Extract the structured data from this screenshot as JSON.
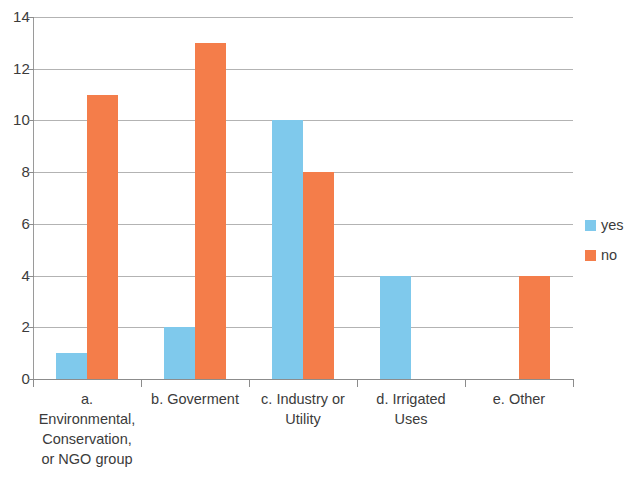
{
  "chart_data": {
    "type": "bar",
    "title": "",
    "xlabel": "",
    "ylabel": "",
    "ylim": [
      0,
      14
    ],
    "ytick_step": 2,
    "yticks": [
      0,
      2,
      4,
      6,
      8,
      10,
      12,
      14
    ],
    "grid": true,
    "legend_position": "right",
    "categories": [
      "a. Environmental, Conservation, or NGO group",
      "b. Goverment",
      "c. Industry or Utility",
      "d. Irrigated Uses",
      "e. Other"
    ],
    "category_lines": [
      [
        "a.",
        "Environmental,",
        "Conservation,",
        "or NGO group"
      ],
      [
        "b. Goverment"
      ],
      [
        "c. Industry or",
        "Utility"
      ],
      [
        "d. Irrigated",
        "Uses"
      ],
      [
        "e. Other"
      ]
    ],
    "series": [
      {
        "name": "yes",
        "color": "#7fc9ec",
        "values": [
          1,
          2,
          10,
          4,
          0
        ]
      },
      {
        "name": "no",
        "color": "#f47d4a",
        "values": [
          11,
          13,
          8,
          0,
          4
        ]
      }
    ]
  },
  "legend": {
    "items": [
      {
        "label": "yes",
        "color": "#7fc9ec"
      },
      {
        "label": "no",
        "color": "#f47d4a"
      }
    ]
  },
  "axis": {
    "y_tick_labels": [
      "14",
      "12",
      "10",
      "8",
      "6",
      "4",
      "2",
      "0"
    ]
  }
}
